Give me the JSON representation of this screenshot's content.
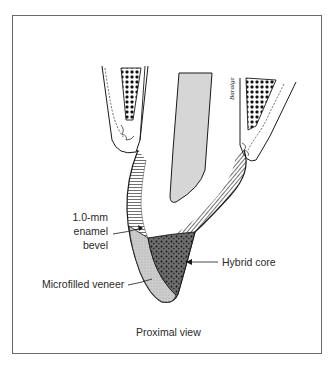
{
  "figure": {
    "view_caption": "Proximal view",
    "signature": "Baralge",
    "labels": {
      "bevel_line1": "1.0-mm",
      "bevel_line2": "enamel",
      "bevel_line3": "bevel",
      "hybrid_core": "Hybrid core",
      "microfilled_veneer": "Microfilled veneer"
    },
    "structures": [
      "alveolar bone (left)",
      "alveolar bone (right)",
      "pulp canal",
      "enamel (hatched)",
      "hybrid composite core",
      "microfilled composite veneer"
    ],
    "colors": {
      "frame": "#6a6a6a",
      "outline": "#1a1a1a",
      "pulp": "#d6d6d6",
      "veneer": "#c8c8c8",
      "core": "#6e6e6e",
      "bone": "#111111"
    }
  }
}
